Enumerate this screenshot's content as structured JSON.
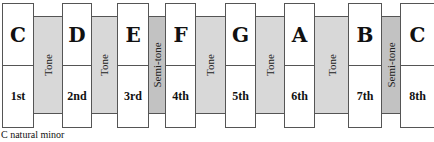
{
  "notes": [
    {
      "name": "C",
      "degree": "1st"
    },
    {
      "name": "D",
      "degree": "2nd"
    },
    {
      "name": "E",
      "degree": "3rd"
    },
    {
      "name": "F",
      "degree": "4th"
    },
    {
      "name": "G",
      "degree": "5th"
    },
    {
      "name": "A",
      "degree": "6th"
    },
    {
      "name": "B",
      "degree": "7th"
    },
    {
      "name": "C",
      "degree": "8th"
    }
  ],
  "steps": [
    {
      "label": "Tone",
      "type": "tone"
    },
    {
      "label": "Tone",
      "type": "tone"
    },
    {
      "label": "Semi-tone",
      "type": "semitone"
    },
    {
      "label": "Tone",
      "type": "tone"
    },
    {
      "label": "Tone",
      "type": "tone"
    },
    {
      "label": "Tone",
      "type": "tone"
    },
    {
      "label": "Semi-tone",
      "type": "semitone"
    }
  ],
  "caption": "C natural minor",
  "colors": {
    "tone": "#d8d8d8",
    "semitone": "#c2c2c2"
  }
}
